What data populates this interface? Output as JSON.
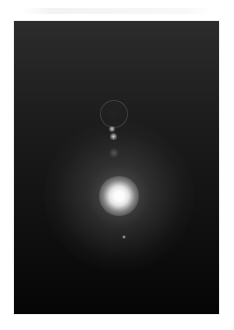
{
  "image": {
    "description": "Photograph of a bright light source (sun/lamp) glowing against a dark background with lens-flare orbs",
    "background_color": "#ffffff",
    "frame": {
      "left": 14,
      "top": 21,
      "width": 205,
      "height": 293,
      "top_color": "#2c2c2c",
      "bottom_color": "#050505"
    },
    "elements": [
      {
        "name": "main-light",
        "cx": 105,
        "cy": 175,
        "size": 40,
        "color": "#ffffff"
      },
      {
        "name": "glow-halo",
        "cx": 105,
        "cy": 175,
        "size": 150
      },
      {
        "name": "flare-ring",
        "cx": 99,
        "cy": 92,
        "size": 26
      },
      {
        "name": "flare-orb-1",
        "cx": 98,
        "cy": 108,
        "size": 6
      },
      {
        "name": "flare-orb-2",
        "cx": 99,
        "cy": 115,
        "size": 7
      },
      {
        "name": "flare-faint-orb",
        "cx": 100,
        "cy": 132,
        "size": 10
      },
      {
        "name": "flare-speck",
        "cx": 110,
        "cy": 216,
        "size": 4
      }
    ]
  }
}
